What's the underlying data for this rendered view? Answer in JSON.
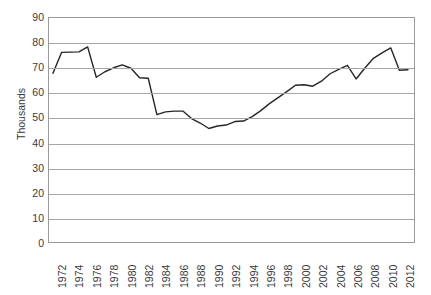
{
  "chart_data": {
    "type": "line",
    "title": "",
    "xlabel": "",
    "ylabel": "Thousands",
    "ylim": [
      0,
      90
    ],
    "ytick_step": 10,
    "yticks": [
      90,
      80,
      70,
      60,
      50,
      40,
      30,
      20,
      10,
      0
    ],
    "grid": true,
    "legend": false,
    "legend_position": "none",
    "line_color": "#262626",
    "xtick_labels": [
      "1972",
      "1974",
      "1976",
      "1978",
      "1980",
      "1982",
      "1984",
      "1986",
      "1988",
      "1990",
      "1992",
      "1994",
      "1996",
      "1998",
      "2000",
      "2002",
      "2004",
      "2006",
      "2008",
      "2010",
      "2012"
    ],
    "xtick_rotation": -90,
    "x": [
      1972,
      1973,
      1974,
      1975,
      1976,
      1977,
      1978,
      1979,
      1980,
      1981,
      1982,
      1983,
      1984,
      1985,
      1986,
      1987,
      1988,
      1989,
      1990,
      1991,
      1992,
      1993,
      1994,
      1995,
      1996,
      1997,
      1998,
      1999,
      2000,
      2001,
      2002,
      2003,
      2004,
      2005,
      2006,
      2007,
      2008,
      2009,
      2010,
      2011,
      2012,
      2013
    ],
    "values": [
      67.8,
      76.2,
      76.3,
      76.4,
      78.4,
      66.2,
      68.4,
      70.0,
      71.2,
      69.8,
      66.0,
      65.8,
      51.2,
      52.3,
      52.6,
      52.6,
      49.6,
      47.8,
      45.6,
      46.6,
      47.0,
      48.4,
      48.6,
      50.4,
      52.8,
      55.6,
      58.0,
      60.4,
      63.0,
      63.2,
      62.6,
      64.6,
      67.6,
      69.4,
      71.0,
      65.5,
      69.8,
      73.8,
      76.0,
      78.0,
      69.0,
      69.2
    ]
  }
}
